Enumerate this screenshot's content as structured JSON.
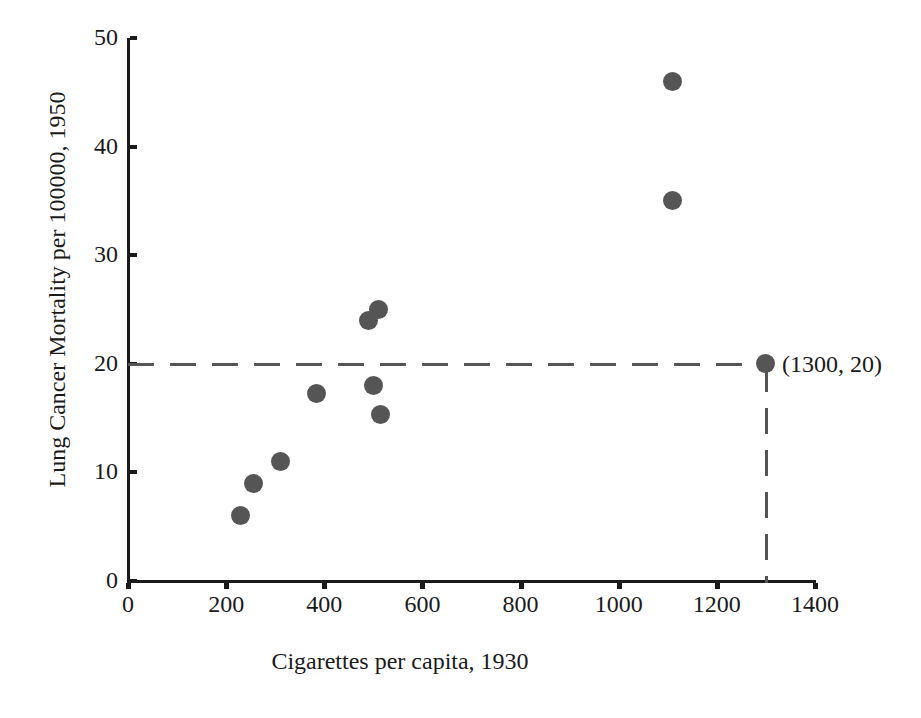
{
  "chart_data": {
    "type": "scatter",
    "title": "",
    "xlabel": "Cigarettes per capita, 1930",
    "ylabel": "Lung Cancer Mortality per 100000, 1950",
    "xlim": [
      0,
      1400
    ],
    "ylim": [
      0,
      50
    ],
    "xticks": [
      0,
      200,
      400,
      600,
      800,
      1000,
      1200,
      1400
    ],
    "yticks": [
      0,
      10,
      20,
      30,
      40,
      50
    ],
    "grid": false,
    "legend": null,
    "point_color": "#555555",
    "axis_color": "#1a1a1a",
    "points": [
      {
        "x": 230,
        "y": 6.0
      },
      {
        "x": 255,
        "y": 9.0
      },
      {
        "x": 310,
        "y": 11.0
      },
      {
        "x": 385,
        "y": 17.3
      },
      {
        "x": 490,
        "y": 24.0
      },
      {
        "x": 510,
        "y": 25.0
      },
      {
        "x": 500,
        "y": 18.0
      },
      {
        "x": 515,
        "y": 15.3
      },
      {
        "x": 1110,
        "y": 46.0
      },
      {
        "x": 1110,
        "y": 35.0
      },
      {
        "x": 1300,
        "y": 20.0
      }
    ],
    "annotations": [
      {
        "text": "(1300, 20)",
        "x": 1300,
        "y": 20
      }
    ],
    "guide_lines": [
      {
        "orientation": "horizontal",
        "value": 20,
        "style": "dashed",
        "color": "#555555"
      },
      {
        "orientation": "vertical",
        "value": 1300,
        "style": "dashed",
        "color": "#555555"
      }
    ]
  }
}
